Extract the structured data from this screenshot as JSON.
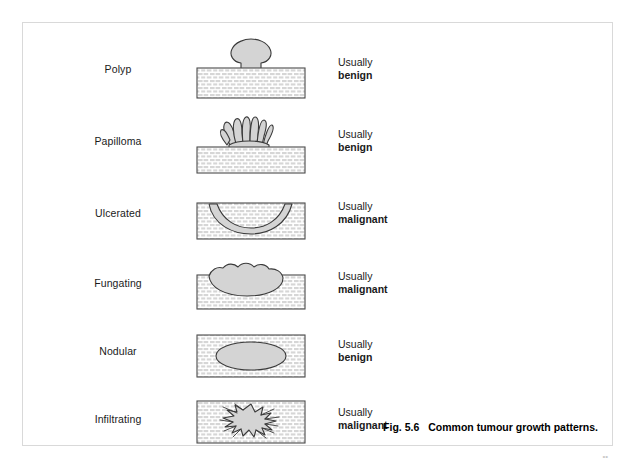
{
  "figure": {
    "number": "Fig. 5.6",
    "caption": "Common tumour growth patterns.",
    "corner_mark": "••"
  },
  "colors": {
    "lesion_fill": "#d4d4d4",
    "lesion_stroke": "#3a3a3a",
    "tissue_fill": "#ffffff",
    "tissue_stroke": "#4a4a4a",
    "hatch": "#cfcfcf",
    "border": "#d9d9d9",
    "text": "#1a1a1a"
  },
  "rows": [
    {
      "label": "Polyp",
      "pattern": "polyp",
      "verdict_prefix": "Usually",
      "verdict_term": "benign"
    },
    {
      "label": "Papilloma",
      "pattern": "papilloma",
      "verdict_prefix": "Usually",
      "verdict_term": "benign"
    },
    {
      "label": "Ulcerated",
      "pattern": "ulcerated",
      "verdict_prefix": "Usually",
      "verdict_term": "malignant"
    },
    {
      "label": "Fungating",
      "pattern": "fungating",
      "verdict_prefix": "Usually",
      "verdict_term": "malignant"
    },
    {
      "label": "Nodular",
      "pattern": "nodular",
      "verdict_prefix": "Usually",
      "verdict_term": "benign"
    },
    {
      "label": "Infiltrating",
      "pattern": "infiltrating",
      "verdict_prefix": "Usually",
      "verdict_term": "malignant"
    }
  ]
}
